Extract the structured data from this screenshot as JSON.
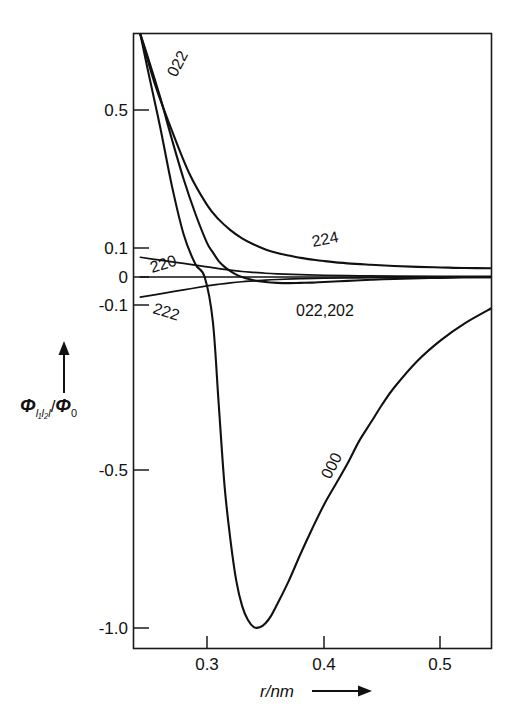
{
  "chart_data": {
    "type": "line",
    "title": "",
    "xlabel": "r/nm",
    "ylabel": "Φ_{l₁l₂l}/Φ₀",
    "xlim": [
      0.243,
      0.545
    ],
    "ylim": [
      -1.05,
      0.83
    ],
    "xticks": [
      0.3,
      0.4,
      0.5
    ],
    "xticklabels": [
      "0.3",
      "0.4",
      "0.5"
    ],
    "yticks": [
      0.5,
      0.1,
      0.0,
      -0.1,
      -0.5,
      -1.0
    ],
    "yticklabels": [
      "0.5",
      "0.1",
      "0",
      "-0.1",
      "-0.5",
      "-1.0"
    ],
    "y_axis_note": "split / non-linear scale: compressed between -0.1 and 0.1",
    "grid": false,
    "legend": "inline-curve-labels",
    "series": [
      {
        "name": "000",
        "label": "000",
        "label_rotation_deg": -62,
        "x": [
          0.243,
          0.25,
          0.26,
          0.27,
          0.28,
          0.29,
          0.298,
          0.305,
          0.31,
          0.315,
          0.32,
          0.325,
          0.33,
          0.335,
          0.34,
          0.345,
          0.35,
          0.355,
          0.36,
          0.37,
          0.38,
          0.39,
          0.4,
          0.41,
          0.42,
          0.43,
          0.44,
          0.45,
          0.46,
          0.48,
          0.5,
          0.52,
          0.545
        ],
        "y": [
          0.83,
          0.66,
          0.45,
          0.28,
          0.14,
          0.045,
          0.0,
          -0.14,
          -0.34,
          -0.55,
          -0.72,
          -0.85,
          -0.93,
          -0.975,
          -0.997,
          -0.998,
          -0.985,
          -0.96,
          -0.925,
          -0.85,
          -0.765,
          -0.685,
          -0.61,
          -0.545,
          -0.485,
          -0.43,
          -0.385,
          -0.34,
          -0.3,
          -0.235,
          -0.185,
          -0.145,
          -0.105
        ]
      },
      {
        "name": "022",
        "label": "022",
        "label_rotation_deg": -62,
        "x": [
          0.243,
          0.25,
          0.26,
          0.27,
          0.28,
          0.29,
          0.3,
          0.305,
          0.31,
          0.315,
          0.32,
          0.325,
          0.33,
          0.34,
          0.35,
          0.36,
          0.37,
          0.38,
          0.39,
          0.4,
          0.42,
          0.44,
          0.46,
          0.5,
          0.545
        ],
        "y": [
          0.83,
          0.72,
          0.555,
          0.415,
          0.3,
          0.2,
          0.115,
          0.085,
          0.055,
          0.035,
          0.02,
          0.008,
          0.0,
          -0.012,
          -0.018,
          -0.021,
          -0.022,
          -0.021,
          -0.02,
          -0.018,
          -0.014,
          -0.01,
          -0.007,
          -0.003,
          -0.001
        ]
      },
      {
        "name": "224",
        "label": "224",
        "label_rotation_deg": -10,
        "x": [
          0.243,
          0.255,
          0.27,
          0.285,
          0.3,
          0.31,
          0.32,
          0.33,
          0.34,
          0.35,
          0.36,
          0.37,
          0.38,
          0.39,
          0.4,
          0.42,
          0.44,
          0.46,
          0.48,
          0.5,
          0.52,
          0.545
        ],
        "y": [
          0.83,
          0.62,
          0.44,
          0.315,
          0.225,
          0.183,
          0.152,
          0.128,
          0.11,
          0.095,
          0.083,
          0.074,
          0.066,
          0.06,
          0.055,
          0.047,
          0.042,
          0.038,
          0.035,
          0.033,
          0.031,
          0.03
        ]
      },
      {
        "name": "220",
        "label": "220",
        "label_rotation_deg": -17,
        "x": [
          0.243,
          0.26,
          0.28,
          0.3,
          0.31,
          0.32,
          0.33,
          0.34,
          0.35,
          0.36,
          0.38,
          0.4,
          0.43,
          0.46,
          0.5,
          0.545
        ],
        "y": [
          0.068,
          0.058,
          0.047,
          0.035,
          0.029,
          0.024,
          0.019,
          0.016,
          0.013,
          0.011,
          0.008,
          0.006,
          0.004,
          0.003,
          0.002,
          0.002
        ]
      },
      {
        "name": "222",
        "label": "222",
        "label_rotation_deg": 17,
        "x": [
          0.243,
          0.26,
          0.28,
          0.3,
          0.31,
          0.32,
          0.33,
          0.34,
          0.35,
          0.36,
          0.38,
          0.4,
          0.43,
          0.46,
          0.5,
          0.545
        ],
        "y": [
          -0.072,
          -0.06,
          -0.046,
          -0.032,
          -0.026,
          -0.021,
          -0.017,
          -0.014,
          -0.011,
          -0.009,
          -0.006,
          -0.004,
          -0.003,
          -0.002,
          -0.001,
          -0.001
        ]
      },
      {
        "name": "022,202",
        "label": "022,202",
        "label_rotation_deg": 0,
        "x": [
          0.243,
          0.3,
          0.33,
          0.345,
          0.545
        ],
        "y": [
          0.0,
          0.0,
          0.0,
          0.0,
          0.0
        ]
      }
    ]
  },
  "axes": {
    "x_axis_label": "r/nm",
    "y_axis_label_parts": {
      "phi": "Φ",
      "subscript": "l₁l₂l",
      "divider": "/",
      "phi0": "Φ",
      "phi0_sub": "0"
    },
    "x_arrow_icon": "right-arrow-icon",
    "y_arrow_icon": "up-arrow-icon"
  },
  "curve_labels": [
    {
      "text": "022",
      "x": 176,
      "y": 78,
      "rotate": -62
    },
    {
      "text": "224",
      "x": 313,
      "y": 247,
      "rotate": -11
    },
    {
      "text": "220",
      "x": 152,
      "y": 273,
      "rotate": -17
    },
    {
      "text": "222",
      "x": 152,
      "y": 313,
      "rotate": 17
    },
    {
      "text": "022,202",
      "x": 296,
      "y": 316,
      "rotate": 0
    },
    {
      "text": "000",
      "x": 330,
      "y": 480,
      "rotate": -62
    }
  ],
  "x_tick_labels": [
    {
      "text": "0.3",
      "x": 207
    },
    {
      "text": "0.4",
      "x": 324
    },
    {
      "text": "0.5",
      "x": 440
    }
  ],
  "y_tick_labels": [
    {
      "text": "0.5",
      "y": 110
    },
    {
      "text": "0.1",
      "y": 248
    },
    {
      "text": "0",
      "y": 277
    },
    {
      "text": "-0.1",
      "y": 305
    },
    {
      "text": "-0.5",
      "y": 470
    },
    {
      "text": "-1.0",
      "y": 628
    }
  ],
  "colors": {
    "background": "#ffffff",
    "ink": "#111111",
    "frame": "#1a1a1a"
  }
}
